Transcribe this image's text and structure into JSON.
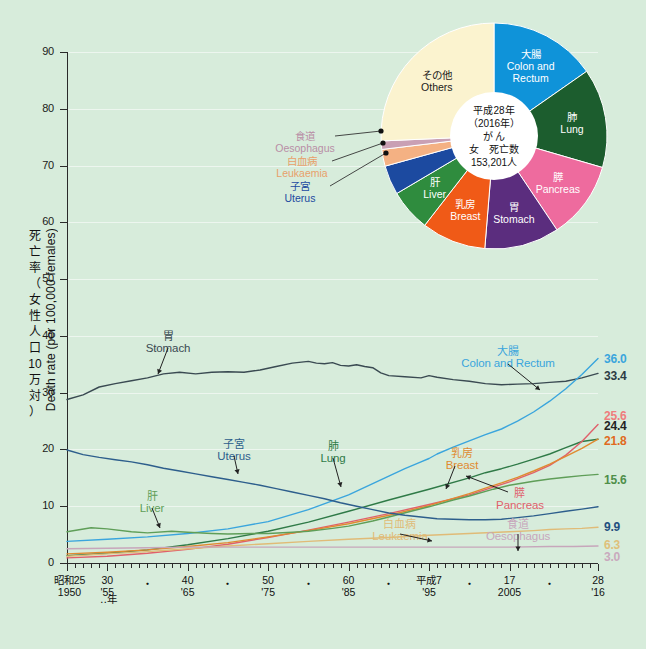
{
  "page": {
    "background_color": "#d7ecdb",
    "title_hidden": true
  },
  "chart_data": {
    "type": "line",
    "title": "",
    "xlabel": "年 (Year)",
    "ylabel": "死亡率（女性人口10万対） Death rate (per 100,000 females)",
    "ylim": [
      0,
      90
    ],
    "xlim": [
      1950,
      2016
    ],
    "grid": true,
    "y_ticks": [
      "0",
      "10",
      "20",
      "30",
      "40",
      "50",
      "60",
      "70",
      "80",
      "90"
    ],
    "x_axis": {
      "unit_label": "‥年",
      "ticks": [
        {
          "x": 1950,
          "era": "昭和25",
          "western": "1950",
          "major": true
        },
        {
          "x": 1955,
          "era": "30",
          "western": "'55",
          "major": true
        },
        {
          "x": 1960,
          "era": "・",
          "western": "",
          "major": false
        },
        {
          "x": 1965,
          "era": "40",
          "western": "'65",
          "major": true
        },
        {
          "x": 1970,
          "era": "・",
          "western": "",
          "major": false
        },
        {
          "x": 1975,
          "era": "50",
          "western": "'75",
          "major": true
        },
        {
          "x": 1980,
          "era": "・",
          "western": "",
          "major": false
        },
        {
          "x": 1985,
          "era": "60",
          "western": "'85",
          "major": true
        },
        {
          "x": 1990,
          "era": "・",
          "western": "",
          "major": false
        },
        {
          "x": 1995,
          "era": "平成7",
          "western": "'95",
          "major": true
        },
        {
          "x": 2000,
          "era": "・",
          "western": "",
          "major": false
        },
        {
          "x": 2005,
          "era": "17",
          "western": "2005",
          "major": true
        },
        {
          "x": 2010,
          "era": "・",
          "western": "",
          "major": false
        },
        {
          "x": 2016,
          "era": "28",
          "western": "'16",
          "major": true
        }
      ]
    },
    "series": [
      {
        "name_jp": "胃",
        "name_en": "Stomach",
        "color": "#3a4a52",
        "end_value": "33.4",
        "end_value_color": "#2c3c44",
        "label_pos": {
          "x": 168,
          "y": 330
        },
        "points": [
          [
            1950,
            28.8
          ],
          [
            1952,
            29.6
          ],
          [
            1954,
            31.0
          ],
          [
            1956,
            31.6
          ],
          [
            1958,
            32.1
          ],
          [
            1960,
            32.6
          ],
          [
            1962,
            33.3
          ],
          [
            1964,
            33.6
          ],
          [
            1966,
            33.3
          ],
          [
            1968,
            33.6
          ],
          [
            1970,
            33.7
          ],
          [
            1972,
            33.6
          ],
          [
            1974,
            34.0
          ],
          [
            1976,
            34.6
          ],
          [
            1978,
            35.2
          ],
          [
            1980,
            35.5
          ],
          [
            1981,
            35.2
          ],
          [
            1982,
            35.1
          ],
          [
            1983,
            35.3
          ],
          [
            1984,
            34.8
          ],
          [
            1985,
            34.7
          ],
          [
            1986,
            34.9
          ],
          [
            1987,
            34.6
          ],
          [
            1988,
            34.4
          ],
          [
            1989,
            33.5
          ],
          [
            1990,
            33.0
          ],
          [
            1992,
            32.8
          ],
          [
            1994,
            32.6
          ],
          [
            1995,
            33.0
          ],
          [
            1996,
            32.7
          ],
          [
            1998,
            32.3
          ],
          [
            2000,
            32.0
          ],
          [
            2002,
            31.6
          ],
          [
            2004,
            31.4
          ],
          [
            2006,
            31.5
          ],
          [
            2008,
            31.6
          ],
          [
            2010,
            31.8
          ],
          [
            2012,
            32.0
          ],
          [
            2014,
            32.6
          ],
          [
            2016,
            33.4
          ]
        ]
      },
      {
        "name_jp": "大腸",
        "name_en": "Colon and Rectum",
        "color": "#3aa5dd",
        "end_value": "36.0",
        "end_value_color": "#3aa5dd",
        "label_pos": {
          "x": 508,
          "y": 345
        },
        "points": [
          [
            1950,
            3.8
          ],
          [
            1955,
            4.2
          ],
          [
            1960,
            4.6
          ],
          [
            1965,
            5.2
          ],
          [
            1970,
            6.0
          ],
          [
            1975,
            7.3
          ],
          [
            1980,
            9.4
          ],
          [
            1985,
            12.0
          ],
          [
            1990,
            15.3
          ],
          [
            1992,
            16.6
          ],
          [
            1994,
            17.8
          ],
          [
            1995,
            18.4
          ],
          [
            1996,
            19.2
          ],
          [
            1998,
            20.4
          ],
          [
            2000,
            21.5
          ],
          [
            2002,
            22.6
          ],
          [
            2004,
            23.6
          ],
          [
            2006,
            25.0
          ],
          [
            2008,
            26.6
          ],
          [
            2010,
            28.5
          ],
          [
            2012,
            30.7
          ],
          [
            2014,
            33.2
          ],
          [
            2016,
            36.0
          ]
        ]
      },
      {
        "name_jp": "肺",
        "name_en": "Lung",
        "color": "#2f7a47",
        "end_value": "25.6",
        "end_value_color": "#ef7d7d",
        "label_pos": {
          "x": 333,
          "y": 440
        },
        "points": [
          [
            1950,
            1.3
          ],
          [
            1955,
            1.7
          ],
          [
            1960,
            2.3
          ],
          [
            1965,
            3.2
          ],
          [
            1970,
            4.3
          ],
          [
            1975,
            5.6
          ],
          [
            1980,
            7.2
          ],
          [
            1985,
            9.1
          ],
          [
            1990,
            11.1
          ],
          [
            1995,
            13.0
          ],
          [
            2000,
            15.0
          ],
          [
            2002,
            15.9
          ],
          [
            2004,
            16.6
          ],
          [
            2006,
            17.4
          ],
          [
            2008,
            18.3
          ],
          [
            2010,
            19.2
          ],
          [
            2012,
            20.3
          ],
          [
            2014,
            21.4
          ],
          [
            2016,
            21.8
          ]
        ]
      },
      {
        "name_jp": "膵",
        "name_en": "Pancreas",
        "color": "#e0606b",
        "end_value": "24.4",
        "end_value_color": "#222222",
        "label_pos": {
          "x": 520,
          "y": 487
        },
        "points": [
          [
            1950,
            0.9
          ],
          [
            1955,
            1.2
          ],
          [
            1960,
            1.7
          ],
          [
            1965,
            2.4
          ],
          [
            1970,
            3.3
          ],
          [
            1975,
            4.5
          ],
          [
            1980,
            5.8
          ],
          [
            1985,
            7.2
          ],
          [
            1990,
            8.7
          ],
          [
            1995,
            10.3
          ],
          [
            2000,
            12.0
          ],
          [
            2005,
            14.3
          ],
          [
            2008,
            15.9
          ],
          [
            2010,
            17.2
          ],
          [
            2012,
            19.0
          ],
          [
            2014,
            21.4
          ],
          [
            2016,
            24.4
          ]
        ]
      },
      {
        "name_jp": "乳房",
        "name_en": "Breast",
        "color": "#e08a30",
        "end_value": "21.8",
        "end_value_color": "#e06a20",
        "label_pos": {
          "x": 462,
          "y": 447
        },
        "points": [
          [
            1950,
            1.6
          ],
          [
            1955,
            1.9
          ],
          [
            1960,
            2.3
          ],
          [
            1965,
            2.9
          ],
          [
            1970,
            3.6
          ],
          [
            1975,
            4.6
          ],
          [
            1980,
            5.7
          ],
          [
            1985,
            6.9
          ],
          [
            1990,
            8.4
          ],
          [
            1995,
            10.1
          ],
          [
            2000,
            12.2
          ],
          [
            2002,
            13.2
          ],
          [
            2004,
            14.1
          ],
          [
            2006,
            15.1
          ],
          [
            2008,
            16.2
          ],
          [
            2010,
            17.4
          ],
          [
            2012,
            18.8
          ],
          [
            2014,
            20.2
          ],
          [
            2016,
            21.8
          ]
        ]
      },
      {
        "name_jp": "肝",
        "name_en": "Liver",
        "color": "#5f9e58",
        "end_value": "15.6",
        "end_value_color": "#4f8f4a",
        "label_pos": {
          "x": 152,
          "y": 490
        },
        "points": [
          [
            1950,
            5.5
          ],
          [
            1953,
            6.2
          ],
          [
            1955,
            6.0
          ],
          [
            1958,
            5.5
          ],
          [
            1960,
            5.3
          ],
          [
            1963,
            5.6
          ],
          [
            1965,
            5.4
          ],
          [
            1968,
            5.2
          ],
          [
            1970,
            5.1
          ],
          [
            1973,
            5.2
          ],
          [
            1975,
            5.2
          ],
          [
            1978,
            5.4
          ],
          [
            1980,
            5.6
          ],
          [
            1983,
            6.1
          ],
          [
            1985,
            6.5
          ],
          [
            1988,
            7.4
          ],
          [
            1990,
            8.1
          ],
          [
            1993,
            9.2
          ],
          [
            1995,
            9.9
          ],
          [
            1998,
            11.1
          ],
          [
            2000,
            11.8
          ],
          [
            2003,
            13.0
          ],
          [
            2005,
            13.7
          ],
          [
            2008,
            14.4
          ],
          [
            2010,
            14.8
          ],
          [
            2012,
            15.1
          ],
          [
            2014,
            15.4
          ],
          [
            2016,
            15.6
          ]
        ]
      },
      {
        "name_jp": "子宮",
        "name_en": "Uterus",
        "color": "#2d5e8c",
        "end_value": "9.9",
        "end_value_color": "#1f4f7f",
        "label_pos": {
          "x": 234,
          "y": 438
        },
        "points": [
          [
            1950,
            19.9
          ],
          [
            1952,
            19.1
          ],
          [
            1954,
            18.6
          ],
          [
            1956,
            18.2
          ],
          [
            1958,
            17.8
          ],
          [
            1960,
            17.3
          ],
          [
            1962,
            16.7
          ],
          [
            1964,
            16.2
          ],
          [
            1966,
            15.7
          ],
          [
            1968,
            15.2
          ],
          [
            1970,
            14.7
          ],
          [
            1972,
            14.2
          ],
          [
            1974,
            13.7
          ],
          [
            1976,
            13.1
          ],
          [
            1978,
            12.5
          ],
          [
            1980,
            11.9
          ],
          [
            1982,
            11.3
          ],
          [
            1984,
            10.6
          ],
          [
            1986,
            10.0
          ],
          [
            1988,
            9.4
          ],
          [
            1990,
            8.8
          ],
          [
            1992,
            8.4
          ],
          [
            1994,
            8.1
          ],
          [
            1996,
            7.8
          ],
          [
            1998,
            7.7
          ],
          [
            2000,
            7.6
          ],
          [
            2002,
            7.6
          ],
          [
            2004,
            7.7
          ],
          [
            2006,
            8.0
          ],
          [
            2008,
            8.3
          ],
          [
            2010,
            8.7
          ],
          [
            2012,
            9.1
          ],
          [
            2014,
            9.5
          ],
          [
            2016,
            9.9
          ]
        ]
      },
      {
        "name_jp": "白血病",
        "name_en": "Leukaemia",
        "color": "#e0bb77",
        "end_value": "6.3",
        "end_value_color": "#dfc07a",
        "label_pos": {
          "x": 400,
          "y": 518
        },
        "points": [
          [
            1950,
            1.2
          ],
          [
            1955,
            1.6
          ],
          [
            1960,
            2.0
          ],
          [
            1965,
            2.5
          ],
          [
            1970,
            3.0
          ],
          [
            1975,
            3.4
          ],
          [
            1980,
            3.8
          ],
          [
            1985,
            4.2
          ],
          [
            1990,
            4.5
          ],
          [
            1995,
            4.9
          ],
          [
            2000,
            5.2
          ],
          [
            2005,
            5.5
          ],
          [
            2008,
            5.7
          ],
          [
            2010,
            5.9
          ],
          [
            2012,
            6.0
          ],
          [
            2014,
            6.1
          ],
          [
            2016,
            6.3
          ]
        ]
      },
      {
        "name_jp": "食道",
        "name_en": "Oesophagus",
        "color": "#c7a6bb",
        "end_value": "3.0",
        "end_value_color": "#c9a9bd",
        "label_pos": {
          "x": 518,
          "y": 518
        },
        "points": [
          [
            1950,
            2.5
          ],
          [
            1955,
            2.6
          ],
          [
            1960,
            2.7
          ],
          [
            1965,
            2.8
          ],
          [
            1970,
            2.8
          ],
          [
            1975,
            2.8
          ],
          [
            1980,
            2.8
          ],
          [
            1985,
            2.8
          ],
          [
            1990,
            2.8
          ],
          [
            1995,
            2.8
          ],
          [
            2000,
            2.8
          ],
          [
            2005,
            2.8
          ],
          [
            2010,
            2.9
          ],
          [
            2013,
            2.9
          ],
          [
            2016,
            3.0
          ]
        ]
      }
    ]
  },
  "pie": {
    "center_lines": [
      "平成28年",
      "（2016年）",
      "が  ん",
      "女　死亡数",
      "153,201人"
    ],
    "slices": [
      {
        "name_jp": "大腸",
        "name_en": "Colon and\nRectum",
        "color": "#0f93d9",
        "pct": 15.3,
        "label_color": "#ffffff"
      },
      {
        "name_jp": "肺",
        "name_en": "Lung",
        "color": "#1c5d2e",
        "pct": 14.2,
        "label_color": "#ffffff"
      },
      {
        "name_jp": "膵",
        "name_en": "Pancreas",
        "color": "#ee6b9e",
        "pct": 11.1,
        "label_color": "#ffffff"
      },
      {
        "name_jp": "胃",
        "name_en": "Stomach",
        "color": "#5b2d7e",
        "pct": 10.7,
        "label_color": "#ffffff"
      },
      {
        "name_jp": "乳房",
        "name_en": "Breast",
        "color": "#f05a17",
        "pct": 9.2,
        "label_color": "#ffffff"
      },
      {
        "name_jp": "肝",
        "name_en": "Liver",
        "color": "#2f8c3e",
        "pct": 6.0,
        "label_color": "#ffffff"
      },
      {
        "name_jp": "子宮",
        "name_en": "Uterus",
        "color": "#1c4aa0",
        "pct": 4.2,
        "label_color": "#1c4aa0"
      },
      {
        "name_jp": "白血病",
        "name_en": "Leukaemia",
        "color": "#f4b183",
        "pct": 2.4,
        "label_color": "#e8a06a"
      },
      {
        "name_jp": "食道",
        "name_en": "Oesophagus",
        "color": "#c9a0b4",
        "pct": 1.2,
        "label_color": "#b98ea6"
      },
      {
        "name_jp": "その他",
        "name_en": "Others",
        "color": "#fbf3cf",
        "pct": 25.7,
        "label_color": "#1a1a1a"
      }
    ]
  }
}
